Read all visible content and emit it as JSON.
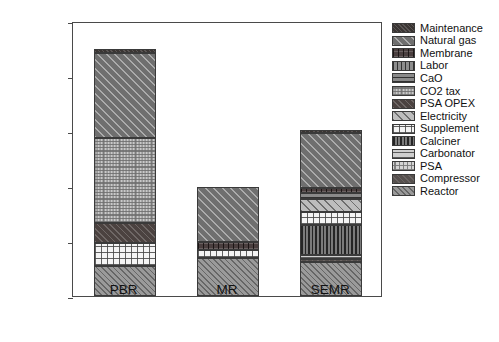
{
  "chart_data": {
    "type": "bar",
    "subtype": "stacked-bar",
    "title": "",
    "xlabel": "",
    "ylabel": "Unit H2 production cost/ USD kg-1",
    "ylabel_html": "Unit H<sub>2</sub> production cost/ USD kg<sup>-1</sup>",
    "categories": [
      "PBR",
      "MR",
      "SEMR"
    ],
    "ylim": [
      0,
      5
    ],
    "yticks": [
      0,
      1,
      2,
      3,
      4,
      5
    ],
    "ytick_labels": [
      "0",
      "1",
      "2",
      "3",
      "4",
      "5"
    ],
    "grid": false,
    "legend_position": "right-outside",
    "totals": [
      4.5,
      1.98,
      3.02
    ],
    "series": [
      {
        "name": "Reactor",
        "pattern": "reactor",
        "values": [
          0.55,
          0.7,
          0.62
        ]
      },
      {
        "name": "Compressor",
        "pattern": "compressor",
        "values": [
          0.0,
          0.0,
          0.06
        ]
      },
      {
        "name": "PSA",
        "pattern": "psa",
        "values": [
          0.0,
          0.0,
          0.0
        ]
      },
      {
        "name": "Carbonator",
        "pattern": "carbonator",
        "values": [
          0.0,
          0.0,
          0.07
        ]
      },
      {
        "name": "Calciner",
        "pattern": "calciner",
        "values": [
          0.0,
          0.0,
          0.55
        ]
      },
      {
        "name": "Supplement",
        "pattern": "supplement",
        "values": [
          0.42,
          0.13,
          0.23
        ]
      },
      {
        "name": "Electricity",
        "pattern": "electricity",
        "values": [
          0.0,
          0.0,
          0.24
        ]
      },
      {
        "name": "PSA OPEX",
        "pattern": "psaopex",
        "values": [
          0.36,
          0.0,
          0.0
        ]
      },
      {
        "name": "CO2 tax",
        "pattern": "co2tax",
        "values": [
          1.55,
          0.0,
          0.0
        ]
      },
      {
        "name": "CaO",
        "pattern": "cao",
        "values": [
          0.0,
          0.0,
          0.11
        ]
      },
      {
        "name": "Labor",
        "pattern": "labor",
        "values": [
          0.0,
          0.0,
          0.0
        ]
      },
      {
        "name": "Membrane",
        "pattern": "membrane",
        "values": [
          0.0,
          0.15,
          0.08
        ]
      },
      {
        "name": "Natural gas",
        "pattern": "naturalgas",
        "values": [
          1.53,
          1.0,
          1.0
        ]
      },
      {
        "name": "Maintenance",
        "pattern": "maintenance",
        "values": [
          0.09,
          0.0,
          0.06
        ]
      }
    ]
  },
  "legend": {
    "items": [
      {
        "label": "Maintenance",
        "pattern": "maintenance"
      },
      {
        "label": "Natural gas",
        "pattern": "naturalgas"
      },
      {
        "label": "Membrane",
        "pattern": "membrane"
      },
      {
        "label": "Labor",
        "pattern": "labor"
      },
      {
        "label": "CaO",
        "pattern": "cao"
      },
      {
        "label": "CO2 tax",
        "pattern": "co2tax"
      },
      {
        "label": "PSA OPEX",
        "pattern": "psaopex"
      },
      {
        "label": "Electricity",
        "pattern": "electricity"
      },
      {
        "label": "Supplement",
        "pattern": "supplement"
      },
      {
        "label": "Calciner",
        "pattern": "calciner"
      },
      {
        "label": "Carbonator",
        "pattern": "carbonator"
      },
      {
        "label": "PSA",
        "pattern": "psa"
      },
      {
        "label": "Compressor",
        "pattern": "compressor"
      },
      {
        "label": "Reactor",
        "pattern": "reactor"
      }
    ]
  },
  "colors": {
    "axis": "#4a4a4a",
    "text": "#111111",
    "background": "#ffffff"
  }
}
